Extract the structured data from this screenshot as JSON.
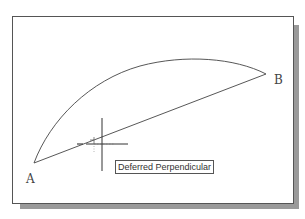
{
  "drawing": {
    "points": {
      "a": {
        "label": "A",
        "x": 34,
        "y": 163
      },
      "b": {
        "label": "B",
        "x": 266,
        "y": 74
      }
    },
    "arc": {
      "from": "A",
      "to": "B",
      "peak_y": 60
    },
    "line": {
      "from": "A",
      "to": "B"
    }
  },
  "cursor": {
    "type": "crosshair",
    "x": 102,
    "y": 144
  },
  "osnap_marker": {
    "type": "deferred-perpendicular-icon"
  },
  "tooltip": {
    "text": "Deferred Perpendicular"
  },
  "colors": {
    "line": "#444444",
    "frame": "#555555",
    "shadow": "#9a9a9a",
    "background": "#ffffff"
  }
}
